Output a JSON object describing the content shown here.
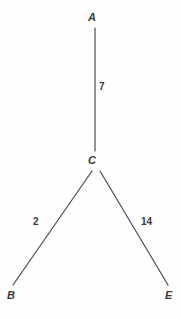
{
  "diagram": {
    "type": "weighted-graph",
    "background_color": "#fefefe",
    "line_color": "#4a4a4a",
    "text_color": "#3a3a3a",
    "nodes": [
      {
        "id": "A",
        "label": "A",
        "x": 95,
        "y": 18
      },
      {
        "id": "C",
        "label": "C",
        "x": 95,
        "y": 161
      },
      {
        "id": "B",
        "label": "B",
        "x": 12,
        "y": 296
      },
      {
        "id": "E",
        "label": "E",
        "x": 170,
        "y": 296
      }
    ],
    "edges": [
      {
        "id": "AC",
        "from": "A",
        "to": "C",
        "weight": "7",
        "x1": 95,
        "y1": 28,
        "x2": 95,
        "y2": 151
      },
      {
        "id": "CB",
        "from": "C",
        "to": "B",
        "weight": "2",
        "x1": 92,
        "y1": 171,
        "x2": 13,
        "y2": 285
      },
      {
        "id": "CE",
        "from": "C",
        "to": "E",
        "weight": "14",
        "x1": 100,
        "y1": 171,
        "x2": 168,
        "y2": 285
      }
    ]
  }
}
